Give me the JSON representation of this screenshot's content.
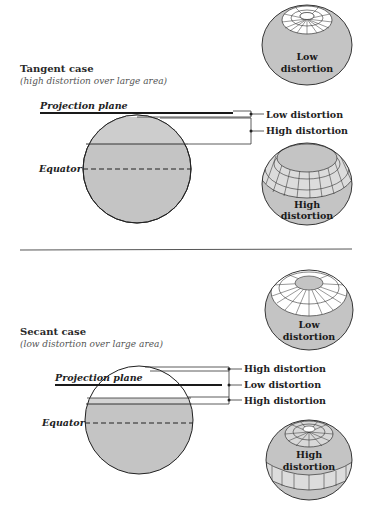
{
  "colors": {
    "globe_fill": "#c4c4c4",
    "band_fill": "#d6d6d6",
    "line": "#222222",
    "grid_fill": "#ffffff"
  },
  "tangent": {
    "title": "Tangent case",
    "subtitle": "(high distortion over large area)",
    "projection_plane_label": "Projection plane",
    "equator_label": "Equator",
    "brackets": [
      {
        "label": "Low distortion"
      },
      {
        "label": "High distortion"
      }
    ],
    "globe_top": {
      "line1": "Low",
      "line2": "distortion"
    },
    "globe_bottom": {
      "line1": "High",
      "line2": "distortion"
    }
  },
  "secant": {
    "title": "Secant case",
    "subtitle": "(low distortion over large area)",
    "projection_plane_label": "Projection plane",
    "equator_label": "Equator",
    "brackets": [
      {
        "label": "High distortion"
      },
      {
        "label": "Low distortion"
      },
      {
        "label": "High distortion"
      }
    ],
    "globe_top": {
      "line1": "Low",
      "line2": "distortion"
    },
    "globe_bottom": {
      "line1": "High",
      "line2": "distortion"
    }
  }
}
